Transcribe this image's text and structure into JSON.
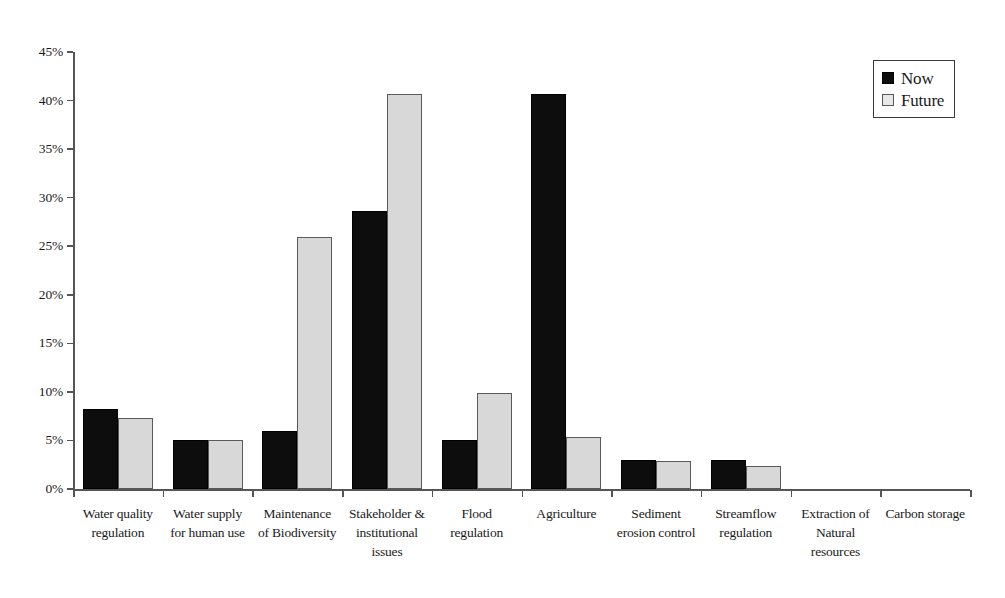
{
  "chart_data": {
    "type": "bar",
    "title": "",
    "xlabel": "",
    "ylabel": "",
    "ylim": [
      0,
      45
    ],
    "y_tick_labels": [
      "0%",
      "5%",
      "10%",
      "15%",
      "20%",
      "25%",
      "30%",
      "35%",
      "40%",
      "45%"
    ],
    "y_tick_values": [
      0,
      5,
      10,
      15,
      20,
      25,
      30,
      35,
      40,
      45
    ],
    "grid": false,
    "legend_position": "top-right",
    "categories": [
      "Water quality regulation",
      "Water supply for human use",
      "Maintenance of Biodiversity",
      "Stakeholder & institutional issues",
      "Flood regulation",
      "Agriculture",
      "Sediment erosion control",
      "Streamflow regulation",
      "Extraction of Natural resources",
      "Carbon storage"
    ],
    "category_lines": [
      [
        "Water quality",
        "regulation"
      ],
      [
        "Water supply",
        "for human use"
      ],
      [
        "Maintenance",
        "of Biodiversity"
      ],
      [
        "Stakeholder &",
        "institutional",
        "issues"
      ],
      [
        "Flood",
        "regulation"
      ],
      [
        "Agriculture"
      ],
      [
        "Sediment",
        "erosion control"
      ],
      [
        "Streamflow",
        "regulation"
      ],
      [
        "Extraction of",
        "Natural",
        "resources"
      ],
      [
        "Carbon storage"
      ]
    ],
    "series": [
      {
        "name": "Now",
        "color": "#0d0d0d",
        "values": [
          8.2,
          5.0,
          6.0,
          28.6,
          5.0,
          40.7,
          3.0,
          3.0,
          0,
          0
        ]
      },
      {
        "name": "Future",
        "color": "#d8d8d8",
        "values": [
          7.3,
          5.0,
          25.9,
          40.7,
          9.9,
          5.4,
          2.9,
          2.4,
          0,
          0
        ]
      }
    ]
  },
  "legend": {
    "items": [
      {
        "label": "Now",
        "swatch": "now"
      },
      {
        "label": "Future",
        "swatch": "future"
      }
    ]
  }
}
